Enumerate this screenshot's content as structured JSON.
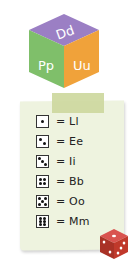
{
  "cube": {
    "top_label": "Dd",
    "left_label": "Pp",
    "right_label": "Uu",
    "colors": {
      "top": "#9b7fc4",
      "left": "#7fbf6a",
      "right": "#f0a23a",
      "text": "#ffffff"
    }
  },
  "tape": {
    "color": "#cdd89e"
  },
  "paper": {
    "color": "#eef3df"
  },
  "key": {
    "rows": [
      {
        "face": 1,
        "text": "= Ll"
      },
      {
        "face": 2,
        "text": "= Ee"
      },
      {
        "face": 3,
        "text": "= Ii"
      },
      {
        "face": 4,
        "text": "= Bb"
      },
      {
        "face": 5,
        "text": "= Oo"
      },
      {
        "face": 6,
        "text": "= Mm"
      }
    ]
  },
  "die": {
    "color": "#c0392b",
    "pip_color": "#ffffff"
  }
}
